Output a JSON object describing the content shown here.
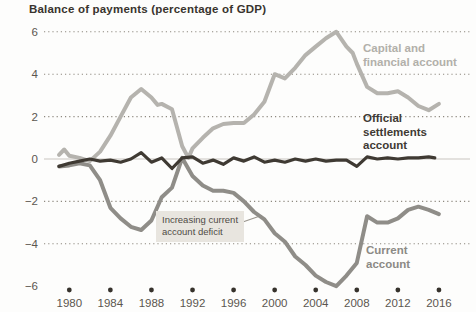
{
  "title": "Balance of payments (percentage of GDP)",
  "chart_data": {
    "type": "line",
    "title": "Balance of payments (percentage of GDP)",
    "xlabel": "",
    "ylabel": "percentage of GDP",
    "xlim": [
      1979,
      2016
    ],
    "ylim": [
      -6,
      6
    ],
    "yticks": [
      6,
      4,
      2,
      0,
      -2,
      -4,
      -6
    ],
    "xticks": [
      1980,
      1984,
      1988,
      1992,
      1996,
      2000,
      2004,
      2008,
      2012,
      2016
    ],
    "grid": "dotted horizontal, solid zero line, bullet dots along x-axis",
    "legend_position": "labels beside lines",
    "series": [
      {
        "name": "Capital and financial account",
        "label_lines": [
          "Capital and",
          "financial account"
        ],
        "color": "#b5b3ae",
        "width": 4,
        "points": [
          [
            1979,
            0.2
          ],
          [
            1979.5,
            0.45
          ],
          [
            1980,
            0.15
          ],
          [
            1981,
            0.05
          ],
          [
            1982,
            -0.1
          ],
          [
            1983,
            0.35
          ],
          [
            1984,
            1.1
          ],
          [
            1985,
            2.0
          ],
          [
            1986,
            2.9
          ],
          [
            1987,
            3.3
          ],
          [
            1988,
            2.9
          ],
          [
            1988.6,
            2.55
          ],
          [
            1989,
            2.6
          ],
          [
            1990,
            2.35
          ],
          [
            1991,
            0.6
          ],
          [
            1991.6,
            0.05
          ],
          [
            1992,
            0.5
          ],
          [
            1993,
            1.0
          ],
          [
            1994,
            1.45
          ],
          [
            1995,
            1.65
          ],
          [
            1996,
            1.7
          ],
          [
            1997,
            1.7
          ],
          [
            1998,
            2.1
          ],
          [
            1999,
            2.7
          ],
          [
            2000,
            4.0
          ],
          [
            2001,
            3.8
          ],
          [
            2002,
            4.3
          ],
          [
            2003,
            4.9
          ],
          [
            2004,
            5.3
          ],
          [
            2005,
            5.7
          ],
          [
            2006,
            6.0
          ],
          [
            2007,
            5.3
          ],
          [
            2007.6,
            5.0
          ],
          [
            2008,
            4.5
          ],
          [
            2009,
            3.4
          ],
          [
            2010,
            3.1
          ],
          [
            2011,
            3.1
          ],
          [
            2012,
            3.2
          ],
          [
            2013,
            2.9
          ],
          [
            2014,
            2.5
          ],
          [
            2015,
            2.3
          ],
          [
            2016,
            2.6
          ]
        ]
      },
      {
        "name": "Current account",
        "label_lines": [
          "Current",
          "account"
        ],
        "color": "#8f8d88",
        "width": 4,
        "points": [
          [
            1979,
            -0.35
          ],
          [
            1980,
            -0.3
          ],
          [
            1981,
            -0.2
          ],
          [
            1982,
            -0.3
          ],
          [
            1983,
            -1.0
          ],
          [
            1984,
            -2.3
          ],
          [
            1985,
            -2.8
          ],
          [
            1986,
            -3.2
          ],
          [
            1987,
            -3.35
          ],
          [
            1988,
            -2.9
          ],
          [
            1989,
            -1.8
          ],
          [
            1990,
            -1.35
          ],
          [
            1991,
            0.05
          ],
          [
            1992,
            -0.8
          ],
          [
            1993,
            -1.25
          ],
          [
            1994,
            -1.5
          ],
          [
            1995,
            -1.5
          ],
          [
            1996,
            -1.6
          ],
          [
            1997,
            -2.0
          ],
          [
            1998,
            -2.5
          ],
          [
            1999,
            -2.85
          ],
          [
            2000,
            -3.5
          ],
          [
            2001,
            -3.9
          ],
          [
            2002,
            -4.6
          ],
          [
            2003,
            -5.0
          ],
          [
            2004,
            -5.5
          ],
          [
            2005,
            -5.8
          ],
          [
            2006,
            -6.0
          ],
          [
            2007,
            -5.5
          ],
          [
            2008,
            -4.9
          ],
          [
            2009,
            -2.7
          ],
          [
            2010,
            -3.0
          ],
          [
            2011,
            -3.0
          ],
          [
            2012,
            -2.8
          ],
          [
            2013,
            -2.4
          ],
          [
            2014,
            -2.25
          ],
          [
            2015,
            -2.4
          ],
          [
            2016,
            -2.6
          ]
        ]
      },
      {
        "name": "Official settlements account",
        "label_lines": [
          "Official",
          "settlements",
          "account"
        ],
        "color": "#3f3a33",
        "width": 3.2,
        "points": [
          [
            1979,
            -0.35
          ],
          [
            1980,
            -0.2
          ],
          [
            1981,
            -0.1
          ],
          [
            1982,
            0
          ],
          [
            1983,
            -0.1
          ],
          [
            1984,
            -0.05
          ],
          [
            1985,
            -0.15
          ],
          [
            1986,
            0
          ],
          [
            1987,
            0.3
          ],
          [
            1988,
            -0.15
          ],
          [
            1989,
            0.05
          ],
          [
            1990,
            -0.45
          ],
          [
            1991,
            0.05
          ],
          [
            1992,
            0.1
          ],
          [
            1993,
            -0.2
          ],
          [
            1994,
            -0.05
          ],
          [
            1995,
            -0.25
          ],
          [
            1996,
            0.05
          ],
          [
            1997,
            -0.1
          ],
          [
            1998,
            0.1
          ],
          [
            1999,
            -0.15
          ],
          [
            2000,
            -0.05
          ],
          [
            2001,
            -0.15
          ],
          [
            2002,
            0
          ],
          [
            2003,
            -0.1
          ],
          [
            2004,
            0
          ],
          [
            2005,
            -0.1
          ],
          [
            2006,
            -0.05
          ],
          [
            2007,
            -0.05
          ],
          [
            2008,
            -0.35
          ],
          [
            2009,
            0.1
          ],
          [
            2010,
            0
          ],
          [
            2011,
            0.05
          ],
          [
            2012,
            0
          ],
          [
            2013,
            0.05
          ],
          [
            2014,
            0.05
          ],
          [
            2015,
            0.1
          ],
          [
            2015.6,
            0.05
          ]
        ]
      }
    ],
    "annotation": {
      "text": "Increasing current account deficit",
      "lines": [
        "Increasing current",
        "account deficit"
      ]
    }
  },
  "colors": {
    "background": "#fdfdfc",
    "title_text": "#39342e",
    "tick_text": "#5b564f",
    "gridline": "#8e897f",
    "zero_line": "#c9c5bf",
    "axis_dot": "#36322c",
    "annotation_bg": "#e8e5df",
    "annotation_text": "#4f4b45"
  }
}
